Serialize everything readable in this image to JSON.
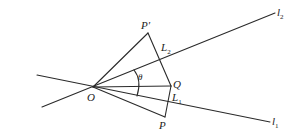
{
  "diagram": {
    "points": {
      "O": {
        "label": "O",
        "x": 93,
        "y": 87
      },
      "P": {
        "label": "P",
        "x": 165,
        "y": 117
      },
      "Pp": {
        "label": "P′",
        "x": 148,
        "y": 33
      },
      "Q": {
        "label": "Q",
        "x": 171,
        "y": 86
      }
    },
    "lines": {
      "l1": {
        "label": "l",
        "sub": "1",
        "from": [
          37,
          75
        ],
        "to": [
          270,
          122
        ]
      },
      "l2": {
        "label": "l",
        "sub": "2",
        "from": [
          42,
          107
        ],
        "to": [
          275,
          13
        ]
      }
    },
    "foot_labels": {
      "L1": {
        "label": "L",
        "sub": "1"
      },
      "L2": {
        "label": "L",
        "sub": "2"
      }
    },
    "angle": {
      "label": "θ"
    },
    "colors": {
      "stroke": "#2a2a2a",
      "text": "#222222",
      "background": "#ffffff"
    }
  }
}
